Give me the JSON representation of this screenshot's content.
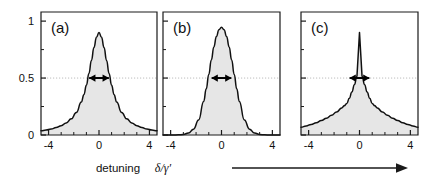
{
  "figure": {
    "background": "#ffffff",
    "axis_color": "#1a1a1a",
    "curve_color": "#111111",
    "fill_color": "#e6e6e6",
    "halfmax_line_color": "#bdbdbd",
    "arrow_color": "#000000",
    "xlabel_word": "detuning",
    "xlabel_symbol": "δ/γ′",
    "trend_arrow": "right-arrow"
  },
  "chart_data": {
    "type": "line",
    "title": "",
    "xlabel": "detuning δ/γ′",
    "ylabel": "",
    "xlim": [
      -4.6,
      4.6
    ],
    "ylim": [
      0,
      1.08
    ],
    "grid": false,
    "legend_position": "none",
    "x_ticks_major": [
      -4,
      0,
      4
    ],
    "x_ticks_major_labels": [
      "-4",
      "0",
      "4"
    ],
    "x_ticks_minor": [
      -3,
      -2,
      -1,
      1,
      2,
      3
    ],
    "y_ticks_major": [
      0,
      0.5,
      1
    ],
    "y_ticks_major_labels": [
      "0",
      "0.5",
      "1"
    ],
    "y_ticks_minor": [
      0.25,
      0.75
    ],
    "halfmax_level": 0.5,
    "panels": [
      {
        "tag": "(a)",
        "lineshape": "lorentzian",
        "peak": 1,
        "center": 0,
        "fwhm": 1.6,
        "x": [
          -4.6,
          -4.2,
          -3.8,
          -3.4,
          -3.0,
          -2.6,
          -2.2,
          -1.8,
          -1.4,
          -1.2,
          -1.0,
          -0.8,
          -0.6,
          -0.4,
          -0.2,
          0,
          0.2,
          0.4,
          0.6,
          0.8,
          1.0,
          1.2,
          1.4,
          1.8,
          2.2,
          2.6,
          3.0,
          3.4,
          3.8,
          4.2,
          4.6
        ],
        "y": [
          0.0364,
          0.0434,
          0.0527,
          0.0653,
          0.0817,
          0.1059,
          0.1419,
          0.1972,
          0.289,
          0.3529,
          0.4369,
          0.5398,
          0.6552,
          0.7685,
          0.8591,
          0.9,
          0.8591,
          0.7685,
          0.6552,
          0.5398,
          0.4369,
          0.3529,
          0.289,
          0.1972,
          0.1419,
          0.1059,
          0.0817,
          0.0653,
          0.0527,
          0.0434,
          0.0364
        ],
        "fwhm_arrow_left_x": -0.8,
        "fwhm_arrow_right_x": 0.8
      },
      {
        "tag": "(b)",
        "lineshape": "gaussian",
        "peak": 1,
        "center": 0,
        "fwhm": 1.6,
        "x": [
          -4.6,
          -4.2,
          -3.8,
          -3.4,
          -3.0,
          -2.6,
          -2.2,
          -1.8,
          -1.4,
          -1.2,
          -1.0,
          -0.8,
          -0.6,
          -0.4,
          -0.2,
          0,
          0.2,
          0.4,
          0.6,
          0.8,
          1.0,
          1.2,
          1.4,
          1.8,
          2.2,
          2.6,
          3.0,
          3.4,
          3.8,
          4.2,
          4.6
        ],
        "y": [
          0.0,
          0.0,
          0.0002,
          0.0011,
          0.0047,
          0.0169,
          0.0513,
          0.1317,
          0.2948,
          0.4055,
          0.5318,
          0.6592,
          0.7737,
          0.8647,
          0.9248,
          0.9455,
          0.9248,
          0.8647,
          0.7737,
          0.6592,
          0.5318,
          0.4055,
          0.2948,
          0.1317,
          0.0513,
          0.0169,
          0.0047,
          0.0011,
          0.0002,
          0.0,
          0.0
        ],
        "fwhm_arrow_left_x": -0.8,
        "fwhm_arrow_right_x": 0.8
      },
      {
        "tag": "(c)",
        "lineshape": "cusped-exponential",
        "peak": 1,
        "center": 0,
        "fwhm": 1.6,
        "x": [
          -4.6,
          -4.2,
          -3.8,
          -3.4,
          -3.0,
          -2.6,
          -2.2,
          -1.8,
          -1.4,
          -1.2,
          -1.0,
          -0.8,
          -0.6,
          -0.4,
          -0.2,
          0,
          0.2,
          0.4,
          0.6,
          0.8,
          1.0,
          1.2,
          1.4,
          1.8,
          2.2,
          2.6,
          3.0,
          3.4,
          3.8,
          4.2,
          4.6
        ],
        "y": [
          0.0678,
          0.0793,
          0.0927,
          0.1084,
          0.1267,
          0.1481,
          0.1732,
          0.2025,
          0.2367,
          0.256,
          0.2768,
          0.3234,
          0.378,
          0.4417,
          0.5162,
          0.9,
          0.5162,
          0.4417,
          0.378,
          0.3234,
          0.2768,
          0.256,
          0.2367,
          0.2025,
          0.1732,
          0.1481,
          0.1267,
          0.1084,
          0.0927,
          0.0793,
          0.0678
        ],
        "fwhm_arrow_left_x": -0.8,
        "fwhm_arrow_right_x": 0.8
      }
    ]
  }
}
